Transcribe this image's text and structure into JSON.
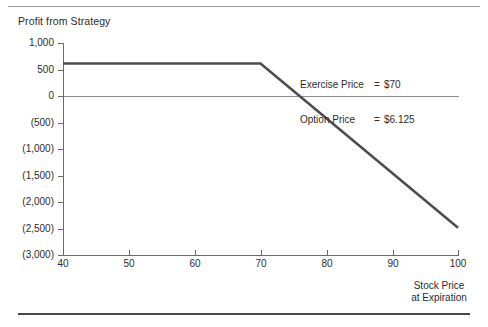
{
  "chart_data": {
    "type": "line",
    "title": "Profit from Strategy",
    "xlabel": "Stock Price\nat Expiration",
    "xlabel_line1": "Stock Price",
    "xlabel_line2": "at Expiration",
    "ylabel": "",
    "xlim": [
      40,
      100
    ],
    "ylim": [
      -3000,
      1000
    ],
    "grid": false,
    "legend": "none",
    "xticks": [
      40,
      50,
      60,
      70,
      80,
      90,
      100
    ],
    "xtick_labels": [
      "40",
      "50",
      "60",
      "70",
      "80",
      "90",
      "100"
    ],
    "yticks": [
      1000,
      500,
      0,
      -500,
      -1000,
      -1500,
      -2000,
      -2500,
      -3000
    ],
    "ytick_labels": [
      "1,000",
      "500",
      "0",
      "(500)",
      "(1,000)",
      "(1,500)",
      "(2,000)",
      "(2,500)",
      "(3,000)"
    ],
    "zero_line": 0,
    "series": [
      {
        "name": "Profit from Strategy",
        "color": "#4d4d4d",
        "x": [
          40,
          70,
          100
        ],
        "values": [
          612.5,
          612.5,
          -2487.5
        ],
        "breakeven_x": 76.125
      }
    ],
    "annotations": [
      {
        "label": "Exercise Price",
        "equals": "=",
        "value": "$70"
      },
      {
        "label": "Option Price",
        "equals": "=",
        "value": "$6.125"
      }
    ],
    "annotation_lines": [
      "Exercise Price = $70",
      "Option Price    = $6.125"
    ]
  },
  "colors": {
    "series": "#4d4d4d",
    "axis": "#6b6b6b",
    "zero_line": "#8d8d8d",
    "rule_top": "#9a9a9a",
    "rule_bottom": "#4a4a4a",
    "text": "#2b2b2b",
    "background": "#ffffff"
  }
}
